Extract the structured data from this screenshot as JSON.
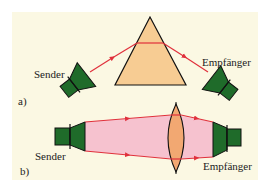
{
  "colors": {
    "background": "#ffffff",
    "panel": "#fbf8e3",
    "device_green": "#1f6b2a",
    "outline": "#111111",
    "ray_red": "#e0303c",
    "prism_fill": "#f7cc93",
    "beam_pink": "#f6c2cf",
    "lens_fill": "#f2a872"
  },
  "panel_a": {
    "label": "a)",
    "sender_label": "Sender",
    "receiver_label": "Empfänger",
    "element": "prism"
  },
  "panel_b": {
    "label": "b)",
    "sender_label": "Sender",
    "receiver_label": "Empfänger",
    "element": "lens"
  }
}
